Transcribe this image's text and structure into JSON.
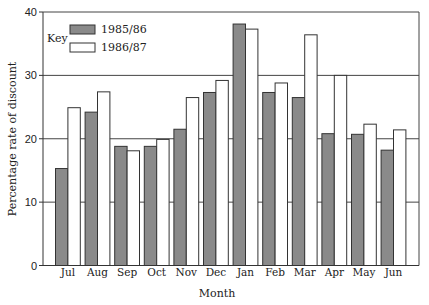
{
  "chart_data": {
    "type": "bar",
    "title": "",
    "xlabel": "Month",
    "ylabel": "Percentage rate of discount",
    "ylim": [
      0,
      40
    ],
    "yticks": [
      0,
      10,
      20,
      30,
      40
    ],
    "grid": "horizontal at 10, 20, 30",
    "legend_title": "Key",
    "legend_position": "upper-left inside",
    "categories": [
      "Jul",
      "Aug",
      "Sep",
      "Oct",
      "Nov",
      "Dec",
      "Jan",
      "Feb",
      "Mar",
      "Apr",
      "May",
      "Jun"
    ],
    "series": [
      {
        "name": "1985/86",
        "color": "#8a8a8a",
        "values": [
          15.3,
          24.2,
          18.8,
          18.8,
          21.5,
          27.3,
          38.1,
          27.3,
          26.5,
          20.8,
          20.7,
          18.2
        ]
      },
      {
        "name": "1986/87",
        "color": "#ffffff",
        "values": [
          24.9,
          27.4,
          18.1,
          19.9,
          26.5,
          29.2,
          37.3,
          28.8,
          36.4,
          30.0,
          22.3,
          21.4
        ]
      }
    ]
  },
  "labels": {
    "xlabel": "Month",
    "ylabel": "Percentage rate of discount",
    "key": "Key",
    "series0": "1985/86",
    "series1": "1986/87"
  }
}
